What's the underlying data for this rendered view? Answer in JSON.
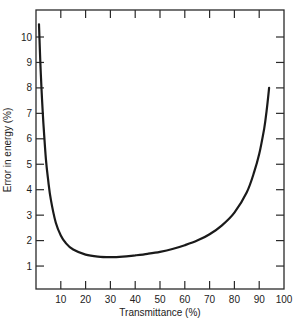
{
  "chart_data": {
    "type": "line",
    "title": "",
    "xlabel": "Transmittance (%)",
    "ylabel": "Error in energy (%)",
    "xlim": [
      0,
      100
    ],
    "ylim": [
      0,
      10.7
    ],
    "grid": false,
    "legend": null,
    "x_ticks": [
      10,
      20,
      30,
      40,
      50,
      60,
      70,
      80,
      90,
      100
    ],
    "y_ticks": [
      1,
      2,
      3,
      4,
      5,
      6,
      7,
      8,
      9,
      10
    ],
    "series": [
      {
        "name": "Error in energy",
        "x": [
          1.2,
          2,
          3,
          4,
          5,
          6,
          8,
          10,
          12,
          15,
          20,
          25,
          30,
          35,
          40,
          45,
          50,
          55,
          60,
          65,
          70,
          75,
          80,
          85,
          88,
          90,
          92,
          93,
          94
        ],
        "y": [
          10.5,
          8.4,
          6.6,
          5.2,
          4.3,
          3.6,
          2.7,
          2.2,
          1.9,
          1.65,
          1.45,
          1.37,
          1.35,
          1.37,
          1.42,
          1.48,
          1.56,
          1.67,
          1.82,
          2.0,
          2.25,
          2.6,
          3.1,
          3.9,
          4.7,
          5.4,
          6.4,
          7.1,
          8.0
        ]
      }
    ]
  },
  "plot": {
    "left": 36,
    "top": 10,
    "right": 284,
    "bottom": 289,
    "y_zero_px": 291.5,
    "px_per_y": 25.45
  },
  "axis": {
    "xlabel": "Transmittance (%)",
    "ylabel": "Error in energy (%)"
  },
  "colors": {
    "line": "#1a1a1a",
    "axis": "#2a2a2a"
  }
}
